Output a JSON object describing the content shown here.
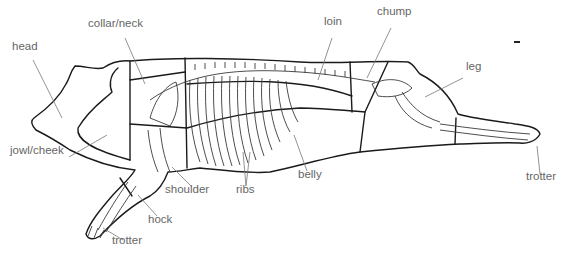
{
  "diagram": {
    "colors": {
      "outline": "#1a1a1a",
      "bone": "#3a3a3a",
      "label": "#666666",
      "leader": "#777777"
    },
    "labels": [
      {
        "id": "head",
        "text": "head",
        "x": 12,
        "y": 47,
        "line": [
          [
            33,
            60
          ],
          [
            62,
            118
          ]
        ]
      },
      {
        "id": "collar-neck",
        "text": "collar/neck",
        "x": 88,
        "y": 24,
        "line": [
          [
            125,
            38
          ],
          [
            145,
            84
          ]
        ]
      },
      {
        "id": "loin",
        "text": "loin",
        "x": 324,
        "y": 22,
        "line": [
          [
            332,
            38
          ],
          [
            318,
            80
          ]
        ]
      },
      {
        "id": "chump",
        "text": "chump",
        "x": 377,
        "y": 12,
        "line": [
          [
            391,
            28
          ],
          [
            367,
            78
          ]
        ]
      },
      {
        "id": "leg",
        "text": "leg",
        "x": 466,
        "y": 67,
        "line": [
          [
            463,
            78
          ],
          [
            425,
            97
          ]
        ]
      },
      {
        "id": "jowl-cheek",
        "text": "jowl/cheek",
        "x": 10,
        "y": 151,
        "line": [
          [
            69,
            157
          ],
          [
            107,
            135
          ]
        ]
      },
      {
        "id": "shoulder",
        "text": "shoulder",
        "x": 165,
        "y": 190,
        "line": [
          [
            192,
            187
          ],
          [
            172,
            167
          ]
        ]
      },
      {
        "id": "ribs",
        "text": "ribs",
        "x": 236,
        "y": 190,
        "line": [
          [
            246,
            186
          ],
          [
            243,
            152
          ]
        ]
      },
      {
        "id": "belly",
        "text": "belly",
        "x": 298,
        "y": 175,
        "line": [
          [
            307,
            171
          ],
          [
            294,
            135
          ]
        ]
      },
      {
        "id": "hock",
        "text": "hock",
        "x": 148,
        "y": 220,
        "line": [
          [
            157,
            216
          ],
          [
            138,
            195
          ]
        ]
      },
      {
        "id": "trotter-front",
        "text": "trotter",
        "x": 112,
        "y": 241,
        "line": [
          [
            123,
            240
          ],
          [
            103,
            228
          ]
        ]
      },
      {
        "id": "trotter-rear",
        "text": "trotter",
        "x": 526,
        "y": 177,
        "line": [
          [
            540,
            174
          ],
          [
            537,
            146
          ]
        ]
      }
    ]
  }
}
